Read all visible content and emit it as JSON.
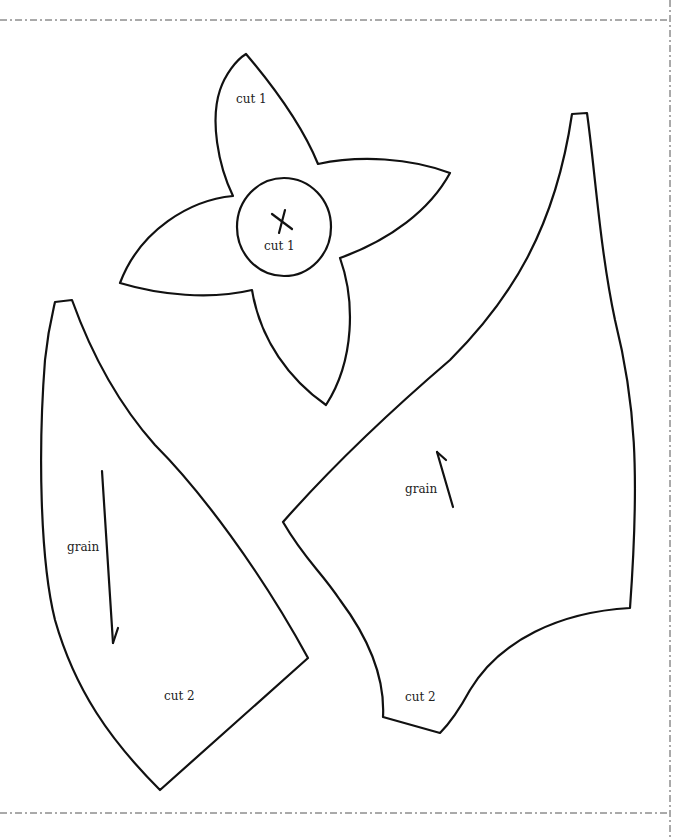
{
  "page": {
    "background": "#ffffff",
    "line_color": "#111111",
    "border_style": "dash-dot"
  },
  "pieces": {
    "flower": {
      "petals_label": "cut 1",
      "center_label": "cut 1",
      "center_mark": "x-mark"
    },
    "leaf_left": {
      "grain_label": "grain",
      "cut_label": "cut 2",
      "grain_direction": "down"
    },
    "leaf_right": {
      "grain_label": "grain",
      "cut_label": "cut 2",
      "grain_direction": "up"
    }
  }
}
